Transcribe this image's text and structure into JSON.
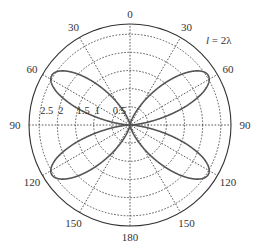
{
  "chart_data": {
    "type": "polar-line",
    "title": "",
    "annotation": "l = 2λ",
    "angular_axis": {
      "zero_direction": "top",
      "direction": "clockwise-mirrored",
      "tick_labels": [
        {
          "angle": 0,
          "label": "0",
          "side": "top"
        },
        {
          "angle": 30,
          "label": "30",
          "side": "left"
        },
        {
          "angle": 30,
          "label": "30",
          "side": "right"
        },
        {
          "angle": 60,
          "label": "60",
          "side": "left"
        },
        {
          "angle": 60,
          "label": "60",
          "side": "right"
        },
        {
          "angle": 90,
          "label": "90",
          "side": "left"
        },
        {
          "angle": 90,
          "label": "90",
          "side": "right"
        },
        {
          "angle": 120,
          "label": "120",
          "side": "left"
        },
        {
          "angle": 120,
          "label": "120",
          "side": "right"
        },
        {
          "angle": 150,
          "label": "150",
          "side": "left"
        },
        {
          "angle": 150,
          "label": "150",
          "side": "right"
        },
        {
          "angle": 180,
          "label": "180",
          "side": "bottom"
        }
      ]
    },
    "radial_axis": {
      "ticks": [
        0.5,
        1,
        1.5,
        2,
        2.5
      ],
      "tick_labels": [
        "0.5",
        "1",
        "1.5",
        "2",
        "2.5"
      ],
      "range": [
        0,
        2.78
      ],
      "grid": "dotted"
    },
    "series": [
      {
        "name": "radiation pattern l = 2λ",
        "description": "Four-lobe pattern of a full-wave (2λ) dipole, lobes peaking near θ ≈ 58° and 122°",
        "theta_deg": [
          0,
          10,
          20,
          30,
          40,
          50,
          55,
          58,
          62,
          70,
          80,
          90,
          100,
          110,
          118,
          122,
          125,
          130,
          140,
          150,
          160,
          170,
          180
        ],
        "r": [
          0,
          0.03,
          0.35,
          1.05,
          1.85,
          2.4,
          2.52,
          2.55,
          2.48,
          1.9,
          0.8,
          0,
          0.8,
          1.9,
          2.48,
          2.55,
          2.52,
          2.4,
          1.85,
          1.05,
          0.35,
          0.03,
          0
        ],
        "symmetric_about_vertical": true
      }
    ]
  }
}
